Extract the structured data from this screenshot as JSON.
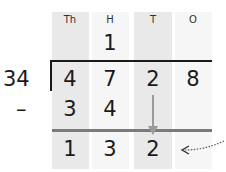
{
  "columns": [
    {
      "label": "Th",
      "shade": "dark"
    },
    {
      "label": "H",
      "shade": "light"
    },
    {
      "label": "T",
      "shade": "dark"
    },
    {
      "label": "O",
      "shade": "light"
    }
  ],
  "quotient": {
    "H": "1"
  },
  "divisor": "34",
  "dividend": [
    "4",
    "7",
    "2",
    "8"
  ],
  "operator": "–",
  "subtrahend": [
    "3",
    "4"
  ],
  "result": [
    "1",
    "3",
    "2"
  ],
  "colors": {
    "dark_column": "#e9e9e9",
    "light_column": "#f6f6f6",
    "arrow": "#9a9a9a",
    "line": "#7b7b7b"
  }
}
